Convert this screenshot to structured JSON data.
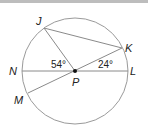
{
  "diagram": {
    "center": {
      "name": "P",
      "x": 75,
      "y": 71
    },
    "radius": 53,
    "points": {
      "J": {
        "label": "J",
        "x": 44,
        "y": 28
      },
      "K": {
        "label": "K",
        "x": 122,
        "y": 48
      },
      "N": {
        "label": "N",
        "x": 22,
        "y": 71
      },
      "L": {
        "label": "L",
        "x": 128,
        "y": 71
      },
      "M": {
        "label": "M",
        "x": 28,
        "y": 93
      },
      "P": {
        "label": "P",
        "x": 75,
        "y": 71
      }
    },
    "segments": [
      "NL",
      "MK",
      "JP",
      "JK"
    ],
    "angles": {
      "JPN": "54°",
      "KPL": "24°"
    },
    "colors": {
      "circle": "#9a9a9a",
      "lines": "#8a8a8a",
      "text": "#222222",
      "topbar": "#bdbdbd"
    }
  }
}
